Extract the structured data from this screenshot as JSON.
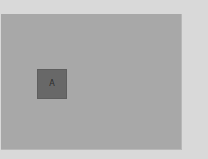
{
  "canvas": {
    "background": "#a8a8a8",
    "tiles": [
      {
        "label": "A",
        "color": "#686868"
      }
    ]
  },
  "page": {
    "background": "#d9d9d9"
  }
}
